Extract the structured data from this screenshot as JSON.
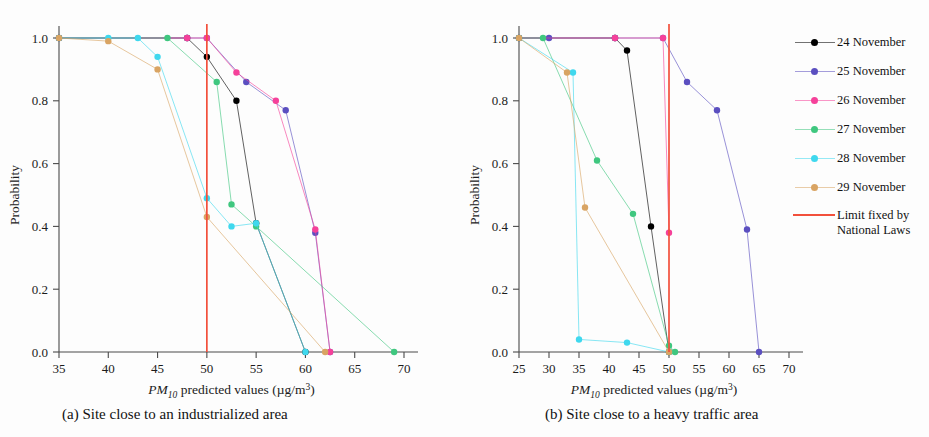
{
  "figure": {
    "caption_a": "(a)  Site close to an industrialized area",
    "caption_b": "(b)  Site close to a heavy traffic area"
  },
  "legend": {
    "items": [
      {
        "label": "24 November",
        "color": "#000000",
        "key": "legend-key-24-november"
      },
      {
        "label": "25 November",
        "color": "#5b4fc0",
        "key": "legend-key-25-november"
      },
      {
        "label": "26 November",
        "color": "#f5419a",
        "key": "legend-key-26-november"
      },
      {
        "label": "27 November",
        "color": "#3fc77f",
        "key": "legend-key-27-november"
      },
      {
        "label": "28 November",
        "color": "#3fd8ee",
        "key": "legend-key-28-november"
      },
      {
        "label": "29 November",
        "color": "#d9a463",
        "key": "legend-key-29-november"
      }
    ],
    "limit": {
      "label_line1": "Limit fixed by",
      "label_line2": "National Laws",
      "color": "#f2503c"
    }
  },
  "chart_data": [
    {
      "type": "line",
      "panel": "a",
      "title": "(a)  Site close to an industrialized area",
      "xlabel": "PM10 predicted values (µg/m³)",
      "ylabel": "Probability",
      "xlim": [
        35,
        70
      ],
      "ylim": [
        0.0,
        1.0
      ],
      "xticks": [
        35,
        40,
        45,
        50,
        55,
        60,
        65,
        70
      ],
      "yticks": [
        0.0,
        0.2,
        0.4,
        0.6,
        0.8,
        1.0
      ],
      "grid": false,
      "annotations": [
        {
          "type": "vline",
          "x": 50,
          "label": "Limit fixed by National Laws",
          "color": "#f2503c"
        }
      ],
      "series": [
        {
          "name": "24 November",
          "color": "#000000",
          "x": [
            35,
            48,
            50,
            53,
            55,
            60
          ],
          "y": [
            1.0,
            1.0,
            0.94,
            0.8,
            0.41,
            0.0
          ]
        },
        {
          "name": "25 November",
          "color": "#5b4fc0",
          "x": [
            35,
            48,
            50,
            54,
            58,
            61,
            62.5
          ],
          "y": [
            1.0,
            1.0,
            1.0,
            0.86,
            0.77,
            0.38,
            0.0
          ]
        },
        {
          "name": "26 November",
          "color": "#f5419a",
          "x": [
            35,
            48,
            50,
            53,
            57,
            61,
            62.5
          ],
          "y": [
            1.0,
            1.0,
            1.0,
            0.89,
            0.8,
            0.39,
            0.0
          ]
        },
        {
          "name": "27 November",
          "color": "#3fc77f",
          "x": [
            35,
            46,
            51,
            52.5,
            55,
            69
          ],
          "y": [
            1.0,
            1.0,
            0.86,
            0.47,
            0.4,
            0.0
          ]
        },
        {
          "name": "28 November",
          "color": "#3fd8ee",
          "x": [
            35,
            40,
            43,
            45,
            50,
            52.5,
            55,
            60
          ],
          "y": [
            1.0,
            1.0,
            1.0,
            0.94,
            0.49,
            0.4,
            0.41,
            0.0
          ]
        },
        {
          "name": "29 November",
          "color": "#d9a463",
          "x": [
            35,
            40,
            45,
            50,
            62
          ],
          "y": [
            1.0,
            0.99,
            0.9,
            0.43,
            0.0
          ]
        }
      ]
    },
    {
      "type": "line",
      "panel": "b",
      "title": "(b)  Site close to a heavy traffic area",
      "xlabel": "PM10 predicted values (µg/m³)",
      "ylabel": "Probability",
      "xlim": [
        25,
        70
      ],
      "ylim": [
        0.0,
        1.0
      ],
      "xticks": [
        25,
        30,
        35,
        40,
        45,
        50,
        55,
        60,
        65,
        70
      ],
      "yticks": [
        0.0,
        0.2,
        0.4,
        0.6,
        0.8,
        1.0
      ],
      "grid": false,
      "annotations": [
        {
          "type": "vline",
          "x": 50,
          "label": "Limit fixed by National Laws",
          "color": "#f2503c"
        }
      ],
      "series": [
        {
          "name": "24 November",
          "color": "#000000",
          "x": [
            25,
            41,
            43,
            47,
            50
          ],
          "y": [
            1.0,
            1.0,
            0.96,
            0.4,
            0.0
          ]
        },
        {
          "name": "25 November",
          "color": "#5b4fc0",
          "x": [
            25,
            30,
            41,
            49,
            53,
            58,
            63,
            65
          ],
          "y": [
            1.0,
            1.0,
            1.0,
            1.0,
            0.86,
            0.77,
            0.39,
            0.0
          ]
        },
        {
          "name": "26 November",
          "color": "#f5419a",
          "x": [
            25,
            41,
            49,
            50
          ],
          "y": [
            1.0,
            1.0,
            1.0,
            0.38
          ]
        },
        {
          "name": "27 November",
          "color": "#3fc77f",
          "x": [
            25,
            29,
            38,
            44,
            50,
            51
          ],
          "y": [
            1.0,
            1.0,
            0.61,
            0.44,
            0.02,
            0.0
          ]
        },
        {
          "name": "28 November",
          "color": "#3fd8ee",
          "x": [
            25,
            34,
            35,
            43,
            50
          ],
          "y": [
            1.0,
            0.89,
            0.04,
            0.03,
            0.0
          ]
        },
        {
          "name": "29 November",
          "color": "#d9a463",
          "x": [
            25,
            33,
            36,
            50
          ],
          "y": [
            1.0,
            0.89,
            0.46,
            0.0
          ]
        }
      ]
    }
  ]
}
